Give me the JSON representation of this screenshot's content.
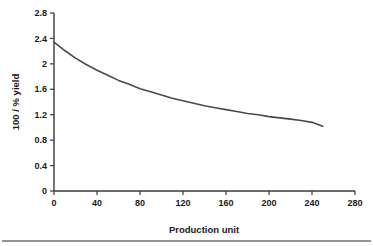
{
  "chart_data": {
    "type": "line",
    "title": "",
    "xlabel": "Production unit",
    "ylabel": "100 / % yield",
    "xlim": [
      0,
      280
    ],
    "ylim": [
      0,
      2.8
    ],
    "xticks": [
      0,
      40,
      80,
      120,
      160,
      200,
      240,
      280
    ],
    "xtick_labels": [
      "0",
      "40",
      "80",
      "120",
      "160",
      "200",
      "240",
      "280"
    ],
    "yticks": [
      0,
      0.4,
      0.8,
      1.2,
      1.6,
      2,
      2.4,
      2.8
    ],
    "ytick_labels": [
      "0",
      "0.4",
      "0.8",
      "1.2",
      "1.6",
      "2",
      "2.4",
      "2.8"
    ],
    "grid": false,
    "legend": false,
    "series": [
      {
        "name": "100 / % yield",
        "color": "#4a4a4a",
        "x": [
          0,
          10,
          20,
          30,
          40,
          50,
          60,
          70,
          80,
          90,
          100,
          110,
          120,
          130,
          140,
          150,
          160,
          170,
          180,
          190,
          200,
          210,
          220,
          230,
          240,
          250
        ],
        "values": [
          2.34,
          2.21,
          2.09,
          1.99,
          1.9,
          1.82,
          1.74,
          1.68,
          1.61,
          1.56,
          1.51,
          1.46,
          1.42,
          1.38,
          1.34,
          1.31,
          1.28,
          1.25,
          1.22,
          1.2,
          1.17,
          1.15,
          1.13,
          1.11,
          1.08,
          1.02
        ]
      }
    ]
  },
  "axis_color": "#3a3a3a",
  "text_color": "#1a1a1a",
  "background": "#ffffff"
}
